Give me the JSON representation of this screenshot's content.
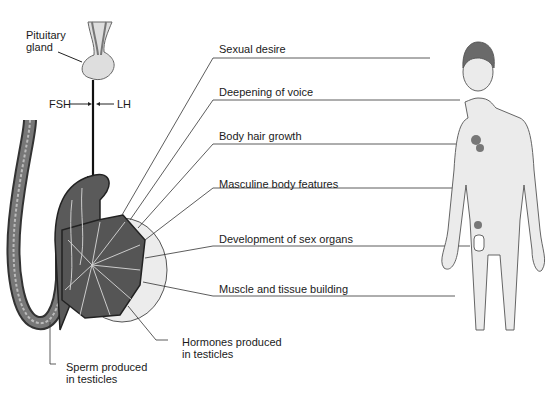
{
  "diagram": {
    "pituitary": {
      "label_line1": "Pituitary",
      "label_line2": "gland"
    },
    "hormones_in": {
      "fsh": "FSH",
      "lh": "LH"
    },
    "effects": [
      {
        "label": "Sexual desire"
      },
      {
        "label": "Deepening of voice"
      },
      {
        "label": "Body hair growth"
      },
      {
        "label": "Masculine body features"
      },
      {
        "label": "Development of sex organs"
      },
      {
        "label": "Muscle and tissue building"
      }
    ],
    "testis_labels": {
      "hormones_line1": "Hormones produced",
      "hormones_line2": "in testicles",
      "sperm_line1": "Sperm produced",
      "sperm_line2": "in testicles"
    },
    "colors": {
      "tissue_dark": "#555555",
      "tissue_light": "#d9d9d9",
      "skin": "#e6e6e6",
      "line": "#333333"
    }
  }
}
